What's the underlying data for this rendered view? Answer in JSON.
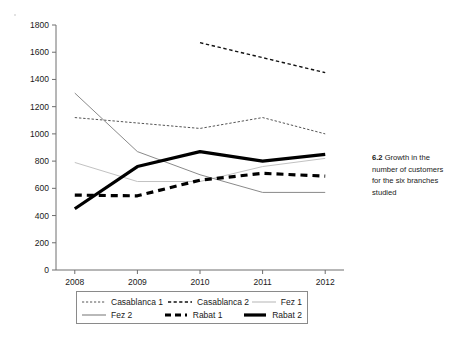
{
  "caption": {
    "number": "6.2",
    "text": "Growth in the number of customers for the six branches studied"
  },
  "chart_data": {
    "type": "line",
    "title": "",
    "xlabel": "",
    "ylabel": "",
    "categories": [
      "2008",
      "2009",
      "2010",
      "2011",
      "2012"
    ],
    "x": [
      2008,
      2009,
      2010,
      2011,
      2012
    ],
    "xlim": [
      2007.7,
      2012.3
    ],
    "ylim": [
      0,
      1800
    ],
    "yticks": [
      0,
      200,
      400,
      600,
      800,
      1000,
      1200,
      1400,
      1600,
      1800
    ],
    "ytick_labels": [
      "0",
      "200",
      "400",
      "600",
      "800",
      "1000",
      "1200",
      "1400",
      "1600",
      "1800"
    ],
    "grid": false,
    "legend_position": "below-axes",
    "series": [
      {
        "name": "Casablanca 1",
        "values": [
          1120,
          1080,
          1040,
          1120,
          1000
        ],
        "style": "fine-dashed",
        "color": "#555555",
        "width": 1
      },
      {
        "name": "Casablanca 2",
        "values": [
          null,
          null,
          1670,
          1560,
          1450
        ],
        "style": "dashed",
        "color": "#111111",
        "width": 1.4
      },
      {
        "name": "Fez 1",
        "values": [
          790,
          650,
          650,
          760,
          820
        ],
        "style": "solid",
        "color": "#c2c2c2",
        "width": 1
      },
      {
        "name": "Fez 2",
        "values": [
          1300,
          870,
          700,
          570,
          570
        ],
        "style": "solid",
        "color": "#8a8a8a",
        "width": 1
      },
      {
        "name": "Rabat 1",
        "values": [
          550,
          545,
          660,
          710,
          690
        ],
        "style": "thick-dashed",
        "color": "#000000",
        "width": 3.2
      },
      {
        "name": "Rabat 2",
        "values": [
          450,
          760,
          870,
          800,
          850
        ],
        "style": "thick-solid",
        "color": "#000000",
        "width": 3.2
      }
    ]
  },
  "legend": {
    "entries": [
      {
        "label": "Casablanca 1",
        "style": "fine-dashed"
      },
      {
        "label": "Casablanca 2",
        "style": "dashed"
      },
      {
        "label": "Fez 1",
        "style": "solid-light"
      },
      {
        "label": "Fez 2",
        "style": "solid-gray"
      },
      {
        "label": "Rabat 1",
        "style": "thick-dashed"
      },
      {
        "label": "Rabat 2",
        "style": "thick-solid"
      }
    ]
  },
  "axes": {
    "y_tick_labels": [
      "1800",
      "1600",
      "1400",
      "1200",
      "1000",
      "800",
      "600",
      "400",
      "200",
      "0"
    ],
    "x_tick_labels": [
      "2008",
      "2009",
      "2010",
      "2011",
      "2012"
    ]
  }
}
